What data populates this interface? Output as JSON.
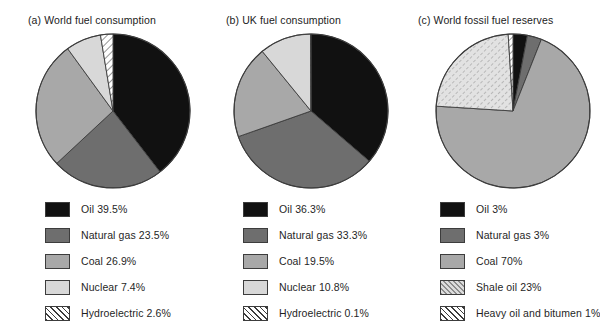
{
  "colors": {
    "oil": "#111111",
    "natural_gas": "#6e6e6e",
    "coal": "#a8a8a8",
    "nuclear": "#d8d8d8",
    "hydroelectric": "#ffffff",
    "shale_oil": "#dcdcdc",
    "heavy_oil": "#ffffff",
    "outline": "#3c3c3c",
    "background": "#ffffff",
    "text": "#1f1f1f"
  },
  "panels": [
    {
      "id": "world-fuel-consumption",
      "title": "(a) World fuel consumption",
      "legend": [
        {
          "label": "Oil 39.5%",
          "key": "oil",
          "fill": "#111111",
          "pattern": "solid"
        },
        {
          "label": "Natural gas 23.5%",
          "key": "natural_gas",
          "fill": "#6e6e6e",
          "pattern": "solid"
        },
        {
          "label": "Coal 26.9%",
          "key": "coal",
          "fill": "#a8a8a8",
          "pattern": "solid"
        },
        {
          "label": "Nuclear 7.4%",
          "key": "nuclear",
          "fill": "#d8d8d8",
          "pattern": "solid"
        },
        {
          "label": "Hydroelectric 2.6%",
          "key": "hydroelectric",
          "fill": "#ffffff",
          "pattern": "diagonal-hatch"
        }
      ]
    },
    {
      "id": "uk-fuel-consumption",
      "title": "(b) UK fuel consumption",
      "legend": [
        {
          "label": "Oil 36.3%",
          "key": "oil",
          "fill": "#111111",
          "pattern": "solid"
        },
        {
          "label": "Natural gas 33.3%",
          "key": "natural_gas",
          "fill": "#6e6e6e",
          "pattern": "solid"
        },
        {
          "label": "Coal 19.5%",
          "key": "coal",
          "fill": "#a8a8a8",
          "pattern": "solid"
        },
        {
          "label": "Nuclear 10.8%",
          "key": "nuclear",
          "fill": "#d8d8d8",
          "pattern": "solid"
        },
        {
          "label": "Hydroelectric 0.1%",
          "key": "hydroelectric",
          "fill": "#ffffff",
          "pattern": "diagonal-hatch"
        }
      ]
    },
    {
      "id": "world-fossil-fuel-reserves",
      "title": "(c) World fossil fuel reserves",
      "legend": [
        {
          "label": "Oil 3%",
          "key": "oil",
          "fill": "#111111",
          "pattern": "solid"
        },
        {
          "label": "Natural gas 3%",
          "key": "natural_gas",
          "fill": "#6e6e6e",
          "pattern": "solid"
        },
        {
          "label": "Coal 70%",
          "key": "coal",
          "fill": "#a8a8a8",
          "pattern": "solid"
        },
        {
          "label": "Shale oil 23%",
          "key": "shale_oil",
          "fill": "#dcdcdc",
          "pattern": "dotted-hatch"
        },
        {
          "label": "Heavy oil and bitumen 1%",
          "key": "heavy_oil",
          "fill": "#ffffff",
          "pattern": "diagonal-hatch"
        }
      ]
    }
  ],
  "chart_data": [
    {
      "type": "pie",
      "title": "(a) World fuel consumption",
      "labels": [
        "Oil",
        "Natural gas",
        "Coal",
        "Nuclear",
        "Hydroelectric"
      ],
      "values": [
        39.5,
        23.5,
        26.9,
        7.4,
        2.6
      ],
      "unit": "%",
      "start_angle_deg": 0,
      "direction": "clockwise",
      "legend_position": "below"
    },
    {
      "type": "pie",
      "title": "(b) UK fuel consumption",
      "labels": [
        "Oil",
        "Natural gas",
        "Coal",
        "Nuclear",
        "Hydroelectric"
      ],
      "values": [
        36.3,
        33.3,
        19.5,
        10.8,
        0.1
      ],
      "unit": "%",
      "start_angle_deg": 0,
      "direction": "clockwise",
      "legend_position": "below"
    },
    {
      "type": "pie",
      "title": "(c) World fossil fuel reserves",
      "labels": [
        "Oil",
        "Natural gas",
        "Coal",
        "Shale oil",
        "Heavy oil and bitumen"
      ],
      "values": [
        3,
        3,
        70,
        23,
        1
      ],
      "unit": "%",
      "start_angle_deg": 0,
      "direction": "clockwise",
      "legend_position": "below"
    }
  ]
}
